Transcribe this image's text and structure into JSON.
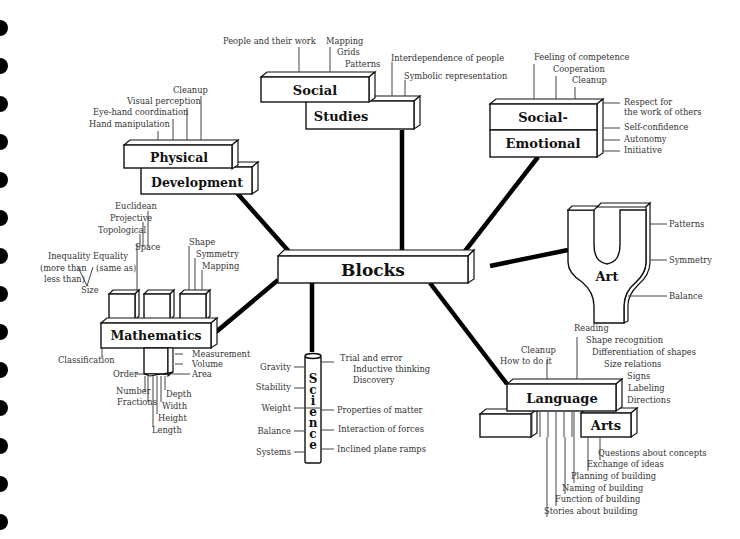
{
  "center": {
    "title": "Blocks"
  },
  "social_studies": {
    "title_line1": "Social",
    "title_line2": "Studies",
    "labels": [
      "People and their work",
      "Mapping",
      "Grids",
      "Patterns",
      "Interdependence of people",
      "Symbolic representation"
    ]
  },
  "social_emotional": {
    "title_line1": "Social-",
    "title_line2": "Emotional",
    "top_labels": [
      "Feeling of competence",
      "Cooperation",
      "Cleanup"
    ],
    "side_labels": [
      "Respect for",
      "the work of others",
      "Self-confidence",
      "Autonomy",
      "Initiative"
    ]
  },
  "physical": {
    "title_line1": "Physical",
    "title_line2": "Development",
    "labels": [
      "Cleanup",
      "Visual perception",
      "Eye-hand coordination",
      "Hand manipulation"
    ]
  },
  "mathematics": {
    "title": "Mathematics",
    "space_labels": [
      "Euclidean",
      "Projective",
      "Topological",
      "Space"
    ],
    "size_labels": [
      "Inequality",
      "(more than",
      "less than)",
      "Equality",
      "(same as)",
      "Size"
    ],
    "shape_labels": [
      "Shape",
      "Symmetry",
      "Mapping"
    ],
    "bottom_labels": [
      "Classification",
      "Measurement",
      "Volume",
      "Area",
      "Order",
      "Number",
      "Fractions",
      "Depth",
      "Width",
      "Height",
      "Length"
    ]
  },
  "science": {
    "title_letters": [
      "S",
      "c",
      "i",
      "e",
      "n",
      "c",
      "e"
    ],
    "left_labels": [
      "Gravity",
      "Stability",
      "Weight",
      "Balance",
      "Systems"
    ],
    "right_labels": [
      "Trial and error",
      "Inductive thinking",
      "Discovery",
      "Properties of matter",
      "Interaction of forces",
      "Inclined plane ramps"
    ]
  },
  "art": {
    "title": "Art",
    "labels": [
      "Patterns",
      "Symmetry",
      "Balance"
    ]
  },
  "language_arts": {
    "title_line1": "Language",
    "title_line2": "Arts",
    "top_labels": [
      "Reading",
      "Shape recognition",
      "Differentiation of shapes",
      "Size relations",
      "Signs",
      "Labeling",
      "Directions",
      "Cleanup",
      "How to do it"
    ],
    "bottom_labels": [
      "Questions about concepts",
      "Exchange of ideas",
      "Planning of building",
      "Naming of building",
      "Function of building",
      "Stories about building"
    ]
  }
}
